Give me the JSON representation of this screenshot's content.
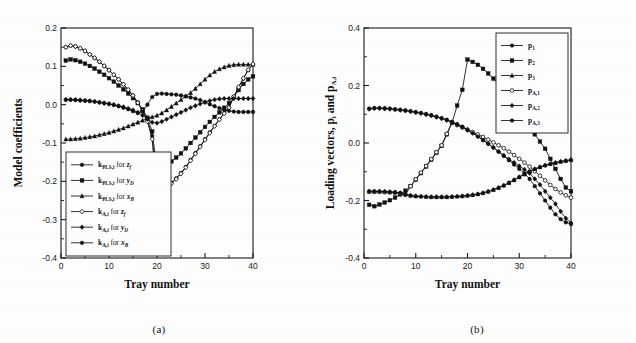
{
  "figure": {
    "panel_a_caption": "(a)",
    "panel_b_caption": "(b)"
  },
  "chart_data": [
    {
      "id": "panel_a",
      "type": "line",
      "title": "",
      "xlabel": "Tray number",
      "ylabel": "Model coefficients",
      "xlim": [
        0,
        40
      ],
      "ylim": [
        -0.4,
        0.2
      ],
      "xticks": [
        0,
        10,
        20,
        30,
        40
      ],
      "yticks": [
        0.2,
        0.1,
        0.0,
        -0.1,
        -0.2,
        -0.3,
        -0.4
      ],
      "xticklabels": [
        "0",
        "10",
        "20",
        "30",
        "40"
      ],
      "yticklabels": [
        "0.2",
        "0.1",
        "0.0",
        "-0.1",
        "-0.2",
        "-0.3",
        "-0.4"
      ],
      "grid": false,
      "legend_position": "lower-left",
      "x": [
        1,
        2,
        3,
        4,
        5,
        6,
        7,
        8,
        9,
        10,
        11,
        12,
        13,
        14,
        15,
        16,
        17,
        18,
        19,
        20,
        21,
        22,
        23,
        24,
        25,
        26,
        27,
        28,
        29,
        30,
        31,
        32,
        33,
        34,
        35,
        36,
        37,
        38,
        39,
        40
      ],
      "series": [
        {
          "name": "k_PLS,i for z_f",
          "label_main": "k",
          "label_sub": "PLS,i",
          "label_mid": " for ",
          "label_var": "z",
          "label_varsub": "f",
          "marker": "circle",
          "values": [
            0.15,
            0.154,
            0.152,
            0.147,
            0.14,
            0.131,
            0.122,
            0.112,
            0.101,
            0.09,
            0.078,
            0.066,
            0.053,
            0.039,
            0.024,
            0.006,
            -0.014,
            -0.04,
            -0.082,
            -0.23,
            -0.222,
            -0.214,
            -0.204,
            -0.192,
            -0.178,
            -0.162,
            -0.144,
            -0.126,
            -0.108,
            -0.09,
            -0.072,
            -0.055,
            -0.038,
            -0.022,
            -0.007,
            0.02,
            0.045,
            0.068,
            0.09,
            0.105
          ]
        },
        {
          "name": "k_PLS,i for y_D",
          "label_main": "k",
          "label_sub": "PLS,i",
          "label_mid": " for ",
          "label_var": "y",
          "label_varsub": "D",
          "marker": "square",
          "values": [
            0.115,
            0.118,
            0.116,
            0.112,
            0.107,
            0.101,
            0.094,
            0.086,
            0.078,
            0.069,
            0.06,
            0.05,
            0.04,
            0.029,
            0.017,
            0.004,
            -0.012,
            -0.034,
            -0.07,
            -0.17,
            -0.163,
            -0.156,
            -0.148,
            -0.138,
            -0.127,
            -0.114,
            -0.1,
            -0.086,
            -0.072,
            -0.058,
            -0.045,
            -0.032,
            -0.02,
            -0.008,
            0.004,
            0.02,
            0.038,
            0.054,
            0.066,
            0.074
          ]
        },
        {
          "name": "k_PLS,i for x_B",
          "label_main": "k",
          "label_sub": "PLS,i",
          "label_mid": " for ",
          "label_var": "x",
          "label_varsub": "B",
          "marker": "triangle",
          "values": [
            -0.09,
            -0.09,
            -0.089,
            -0.088,
            -0.086,
            -0.084,
            -0.082,
            -0.079,
            -0.076,
            -0.073,
            -0.069,
            -0.065,
            -0.061,
            -0.056,
            -0.051,
            -0.046,
            -0.041,
            -0.036,
            -0.032,
            -0.028,
            -0.022,
            -0.014,
            -0.005,
            0.004,
            0.013,
            0.022,
            0.031,
            0.042,
            0.054,
            0.066,
            0.077,
            0.086,
            0.093,
            0.098,
            0.102,
            0.104,
            0.105,
            0.105,
            0.105,
            0.105
          ]
        },
        {
          "name": "k_A,i for z_f",
          "label_main": "k",
          "label_sub": "A,i",
          "label_mid": " for ",
          "label_var": "z",
          "label_varsub": "f",
          "marker": "open-diamond",
          "values": [
            0.15,
            0.154,
            0.152,
            0.147,
            0.14,
            0.131,
            0.122,
            0.112,
            0.101,
            0.09,
            0.078,
            0.066,
            0.053,
            0.039,
            0.024,
            0.005,
            -0.016,
            -0.044,
            -0.09,
            -0.232,
            -0.224,
            -0.216,
            -0.206,
            -0.194,
            -0.18,
            -0.164,
            -0.146,
            -0.128,
            -0.11,
            -0.092,
            -0.074,
            -0.056,
            -0.039,
            -0.023,
            -0.008,
            0.021,
            0.046,
            0.069,
            0.091,
            0.106
          ]
        },
        {
          "name": "k_A,i for y_D",
          "label_main": "k",
          "label_sub": "A,i",
          "label_mid": " for ",
          "label_var": "y",
          "label_varsub": "D",
          "marker": "diamond",
          "values": [
            0.013,
            0.013,
            0.013,
            0.012,
            0.011,
            0.01,
            0.008,
            0.006,
            0.004,
            0.002,
            0.0,
            -0.003,
            -0.006,
            -0.01,
            -0.014,
            -0.02,
            -0.028,
            -0.038,
            -0.046,
            -0.048,
            -0.044,
            -0.038,
            -0.032,
            -0.026,
            -0.02,
            -0.014,
            -0.008,
            -0.003,
            0.002,
            0.006,
            0.01,
            0.013,
            0.015,
            0.016,
            0.016,
            0.016,
            0.016,
            0.016,
            0.016,
            0.016
          ]
        },
        {
          "name": "k_A,i for x_B",
          "label_main": "k",
          "label_sub": "A,i",
          "label_mid": " for ",
          "label_var": "x",
          "label_varsub": "B",
          "marker": "circle",
          "values": [
            0.013,
            0.013,
            0.012,
            0.011,
            0.01,
            0.009,
            0.008,
            0.006,
            0.004,
            0.002,
            -0.001,
            -0.004,
            -0.008,
            -0.012,
            -0.017,
            -0.022,
            -0.018,
            0.0,
            0.02,
            0.028,
            0.029,
            0.028,
            0.027,
            0.026,
            0.024,
            0.022,
            0.019,
            0.016,
            0.012,
            0.007,
            0.001,
            -0.004,
            -0.009,
            -0.013,
            -0.016,
            -0.018,
            -0.019,
            -0.019,
            -0.019,
            -0.019
          ]
        }
      ]
    },
    {
      "id": "panel_b",
      "type": "line",
      "title": "",
      "xlabel": "Tray number",
      "ylabel": "Loading vectors, p_i and p_A,i",
      "ylabel_main": "Loading vectors, ",
      "ylabel_p1": "p",
      "ylabel_p1sub": "i",
      "ylabel_and": " and ",
      "ylabel_p2": "p",
      "ylabel_p2sub": "A,i",
      "xlim": [
        0,
        40
      ],
      "ylim": [
        -0.4,
        0.4
      ],
      "xticks": [
        0,
        10,
        20,
        30,
        40
      ],
      "yticks": [
        0.4,
        0.2,
        0.0,
        -0.2,
        -0.4
      ],
      "xticklabels": [
        "0",
        "10",
        "20",
        "30",
        "40"
      ],
      "yticklabels": [
        "0.4",
        "0.2",
        "0.0",
        "-0.2",
        "-0.4"
      ],
      "grid": false,
      "legend_position": "upper-right",
      "x": [
        1,
        2,
        3,
        4,
        5,
        6,
        7,
        8,
        9,
        10,
        11,
        12,
        13,
        14,
        15,
        16,
        17,
        18,
        19,
        20,
        21,
        22,
        23,
        24,
        25,
        26,
        27,
        28,
        29,
        30,
        31,
        32,
        33,
        34,
        35,
        36,
        37,
        38,
        39,
        40
      ],
      "series": [
        {
          "name": "p_1",
          "label_main": "p",
          "label_sub": "1",
          "marker": "circle",
          "values": [
            0.12,
            0.122,
            0.122,
            0.121,
            0.12,
            0.118,
            0.116,
            0.114,
            0.111,
            0.108,
            0.105,
            0.101,
            0.097,
            0.092,
            0.087,
            0.081,
            0.074,
            0.066,
            0.057,
            0.047,
            0.036,
            0.024,
            0.011,
            -0.002,
            -0.016,
            -0.03,
            -0.045,
            -0.06,
            -0.075,
            -0.09,
            -0.105,
            -0.125,
            -0.15,
            -0.175,
            -0.2,
            -0.225,
            -0.248,
            -0.265,
            -0.276,
            -0.282
          ]
        },
        {
          "name": "p_2",
          "label_main": "p",
          "label_sub": "2",
          "marker": "square",
          "values": [
            -0.215,
            -0.22,
            -0.214,
            -0.207,
            -0.199,
            -0.19,
            -0.179,
            -0.166,
            -0.15,
            -0.128,
            -0.105,
            -0.082,
            -0.058,
            -0.034,
            -0.01,
            0.03,
            0.07,
            0.13,
            0.185,
            0.29,
            0.282,
            0.272,
            0.258,
            0.242,
            0.224,
            0.204,
            0.183,
            0.161,
            0.139,
            0.117,
            0.096,
            0.06,
            0.03,
            0.005,
            -0.02,
            -0.055,
            -0.09,
            -0.125,
            -0.155,
            -0.168
          ]
        },
        {
          "name": "p_3",
          "label_main": "p",
          "label_sub": "3",
          "marker": "triangle",
          "values": [
            -0.168,
            -0.168,
            -0.168,
            -0.169,
            -0.17,
            -0.171,
            -0.173,
            -0.178,
            -0.182,
            -0.184,
            -0.185,
            -0.186,
            -0.187,
            -0.187,
            -0.187,
            -0.187,
            -0.186,
            -0.185,
            -0.184,
            -0.182,
            -0.18,
            -0.177,
            -0.173,
            -0.168,
            -0.162,
            -0.155,
            -0.147,
            -0.138,
            -0.128,
            -0.118,
            -0.108,
            -0.098,
            -0.09,
            -0.083,
            -0.077,
            -0.072,
            -0.068,
            -0.064,
            -0.061,
            -0.058
          ]
        },
        {
          "name": "p_A,1",
          "label_main": "p",
          "label_sub": "A,1",
          "marker": "open-circle",
          "values": [
            -0.17,
            -0.17,
            -0.17,
            -0.171,
            -0.172,
            -0.173,
            -0.175,
            -0.18,
            -0.15,
            -0.126,
            -0.103,
            -0.08,
            -0.056,
            -0.032,
            -0.008,
            0.032,
            0.072,
            0.062,
            0.054,
            0.046,
            0.038,
            0.03,
            0.021,
            0.012,
            0.002,
            -0.008,
            -0.018,
            -0.03,
            -0.042,
            -0.055,
            -0.068,
            -0.082,
            -0.098,
            -0.114,
            -0.13,
            -0.146,
            -0.16,
            -0.172,
            -0.182,
            -0.19
          ]
        },
        {
          "name": "p_A,2",
          "label_main": "p",
          "label_sub": "A,2",
          "marker": "diamond",
          "values": [
            0.118,
            0.12,
            0.12,
            0.119,
            0.118,
            0.116,
            0.114,
            0.112,
            0.109,
            0.106,
            0.103,
            0.099,
            0.095,
            0.09,
            0.085,
            0.079,
            0.072,
            0.064,
            0.055,
            0.045,
            0.034,
            0.022,
            0.01,
            -0.003,
            -0.016,
            -0.03,
            -0.043,
            -0.056,
            -0.068,
            -0.08,
            -0.092,
            -0.105,
            -0.125,
            -0.145,
            -0.168,
            -0.19,
            -0.212,
            -0.238,
            -0.262,
            -0.278
          ]
        },
        {
          "name": "p_A,3",
          "label_main": "p",
          "label_sub": "A,3",
          "marker": "circle",
          "values": [
            -0.168,
            -0.168,
            -0.168,
            -0.169,
            -0.17,
            -0.171,
            -0.174,
            -0.179,
            -0.183,
            -0.185,
            -0.186,
            -0.187,
            -0.188,
            -0.188,
            -0.188,
            -0.188,
            -0.187,
            -0.186,
            -0.185,
            -0.183,
            -0.181,
            -0.178,
            -0.174,
            -0.169,
            -0.163,
            -0.156,
            -0.148,
            -0.139,
            -0.129,
            -0.119,
            -0.109,
            -0.099,
            -0.091,
            -0.084,
            -0.078,
            -0.073,
            -0.069,
            -0.065,
            -0.062,
            -0.059
          ]
        }
      ]
    }
  ]
}
